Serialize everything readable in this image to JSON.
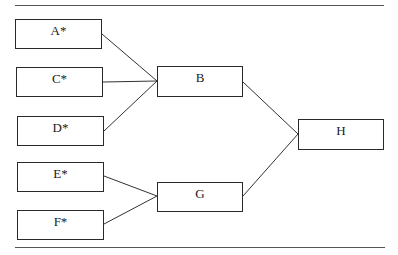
{
  "diagram": {
    "type": "tree-merge",
    "nodes": [
      {
        "id": "A",
        "label": "A*",
        "x": 15,
        "y": 19,
        "w": 87,
        "h": 30
      },
      {
        "id": "C",
        "label": "C*",
        "x": 16,
        "y": 67,
        "w": 87,
        "h": 30
      },
      {
        "id": "D",
        "label": "D*",
        "x": 17,
        "y": 116,
        "w": 87,
        "h": 30
      },
      {
        "id": "E",
        "label": "E*",
        "x": 17,
        "y": 162,
        "w": 87,
        "h": 30
      },
      {
        "id": "F",
        "label": "F*",
        "x": 17,
        "y": 210,
        "w": 87,
        "h": 30
      },
      {
        "id": "B",
        "label": "B",
        "x": 157,
        "y": 66,
        "w": 86,
        "h": 31
      },
      {
        "id": "G",
        "label": "G",
        "x": 157,
        "y": 182,
        "w": 86,
        "h": 30
      },
      {
        "id": "H",
        "label": "H",
        "x": 298,
        "y": 119,
        "w": 86,
        "h": 31
      }
    ],
    "edges": [
      {
        "from": "A",
        "to": "B"
      },
      {
        "from": "C",
        "to": "B"
      },
      {
        "from": "D",
        "to": "B"
      },
      {
        "from": "E",
        "to": "G"
      },
      {
        "from": "F",
        "to": "G"
      },
      {
        "from": "B",
        "to": "H"
      },
      {
        "from": "G",
        "to": "H"
      }
    ],
    "rules": {
      "top": {
        "x": 15,
        "y": 5,
        "w": 369
      },
      "bottom": {
        "x": 15,
        "y": 247,
        "w": 370
      }
    }
  }
}
